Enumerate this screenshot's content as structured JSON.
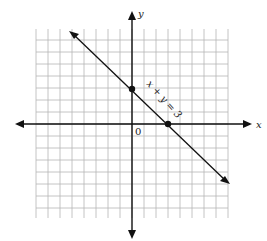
{
  "diagram": {
    "type": "coordinate-graph",
    "equation_label": "x + y = 3",
    "x_axis_label": "x",
    "y_axis_label": "y",
    "origin_label": "0",
    "points": [
      {
        "x": 0,
        "y": 3,
        "label": "y-intercept"
      },
      {
        "x": 3,
        "y": 0,
        "label": "x-intercept"
      }
    ],
    "grid": {
      "x_min": -8,
      "x_max": 8,
      "y_min": -8,
      "y_max": 8
    },
    "colors": {
      "grid": "#b0b0b0",
      "axes": "#111111",
      "line": "#111111"
    }
  }
}
